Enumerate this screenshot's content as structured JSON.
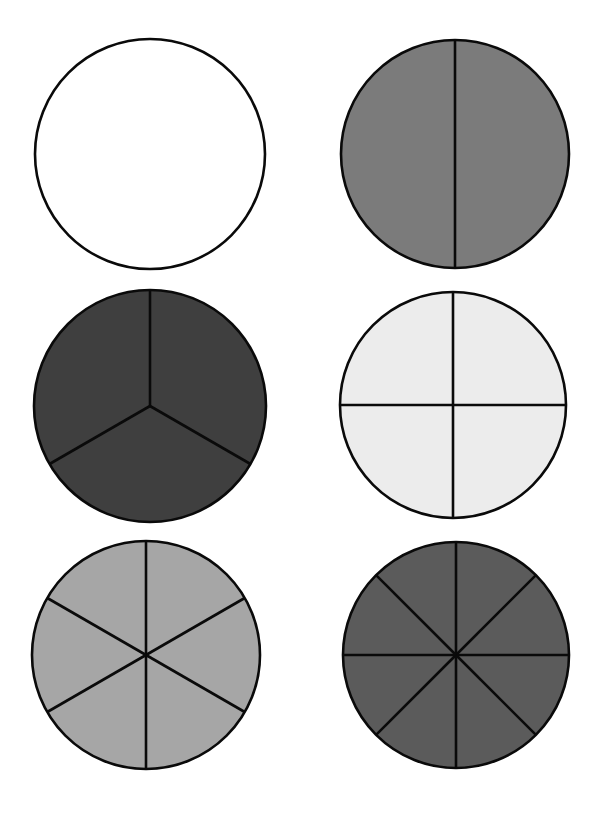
{
  "page": {
    "width": 601,
    "height": 816,
    "background": "#ffffff"
  },
  "style": {
    "stroke": "#0a0a0a",
    "stroke_width": 2.6
  },
  "circles": [
    {
      "name": "fraction-circle-whole",
      "parts": 1,
      "cx": 150,
      "cy": 154,
      "r": 115,
      "fill": "#ffffff"
    },
    {
      "name": "fraction-circle-halves",
      "parts": 2,
      "cx": 455,
      "cy": 154,
      "r": 114,
      "fill": "#7b7b7b"
    },
    {
      "name": "fraction-circle-thirds",
      "parts": 3,
      "cx": 150,
      "cy": 406,
      "r": 116,
      "fill": "#3f3f3f"
    },
    {
      "name": "fraction-circle-quarters",
      "parts": 4,
      "cx": 453,
      "cy": 405,
      "r": 113,
      "fill": "#ececec"
    },
    {
      "name": "fraction-circle-sixths",
      "parts": 6,
      "cx": 146,
      "cy": 655,
      "r": 114,
      "fill": "#a6a6a6"
    },
    {
      "name": "fraction-circle-eighths",
      "parts": 8,
      "cx": 456,
      "cy": 655,
      "r": 113,
      "fill": "#5b5b5b"
    }
  ]
}
